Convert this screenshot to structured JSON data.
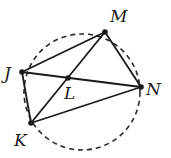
{
  "diagram": {
    "type": "geometry-cyclic-quadrilateral",
    "circle": {
      "cx": 82,
      "cy": 92,
      "r": 58,
      "style": "dashed"
    },
    "points": [
      {
        "name": "J",
        "x": 22,
        "y": 72,
        "label": "J",
        "lx": 4,
        "ly": 79
      },
      {
        "name": "M",
        "x": 105,
        "y": 32,
        "label": "M",
        "lx": 110,
        "ly": 22
      },
      {
        "name": "N",
        "x": 141,
        "y": 87,
        "label": "N",
        "lx": 146,
        "ly": 95
      },
      {
        "name": "K",
        "x": 31,
        "y": 123,
        "label": "K",
        "lx": 14,
        "ly": 146
      },
      {
        "name": "L",
        "x": 68,
        "y": 78,
        "label": "L",
        "lx": 64,
        "ly": 99
      }
    ],
    "segments": [
      [
        "J",
        "M"
      ],
      [
        "M",
        "N"
      ],
      [
        "N",
        "K"
      ],
      [
        "K",
        "J"
      ],
      [
        "J",
        "N"
      ],
      [
        "K",
        "M"
      ]
    ]
  }
}
